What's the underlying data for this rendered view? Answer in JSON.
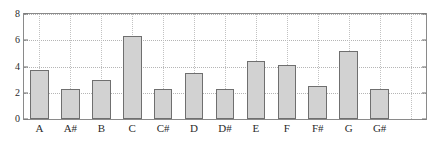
{
  "chart_data": {
    "type": "bar",
    "title": "",
    "subtitle": "",
    "xlabel": "",
    "ylabel": "",
    "categories": [
      "A",
      "A#",
      "B",
      "C",
      "C#",
      "D",
      "D#",
      "E",
      "F",
      "F#",
      "G",
      "G#"
    ],
    "values": [
      3.7,
      2.3,
      2.95,
      6.35,
      2.25,
      3.5,
      2.3,
      4.4,
      4.1,
      2.5,
      5.15,
      2.3
    ],
    "ylim": [
      0,
      8
    ],
    "yticks": [
      0,
      2,
      4,
      6,
      8
    ],
    "ytick_labels": [
      "0",
      "2",
      "4",
      "6",
      "8"
    ],
    "grid": true,
    "legend": null,
    "annotations": [],
    "slot_count": 13,
    "colors": {
      "bar_fill": "#d2d2d2",
      "bar_edge": "#6f6f6f",
      "axis": "#8a8a8a",
      "grid": "#b5b5b5",
      "text": "#2b2b2b",
      "background": "#ffffff"
    }
  }
}
